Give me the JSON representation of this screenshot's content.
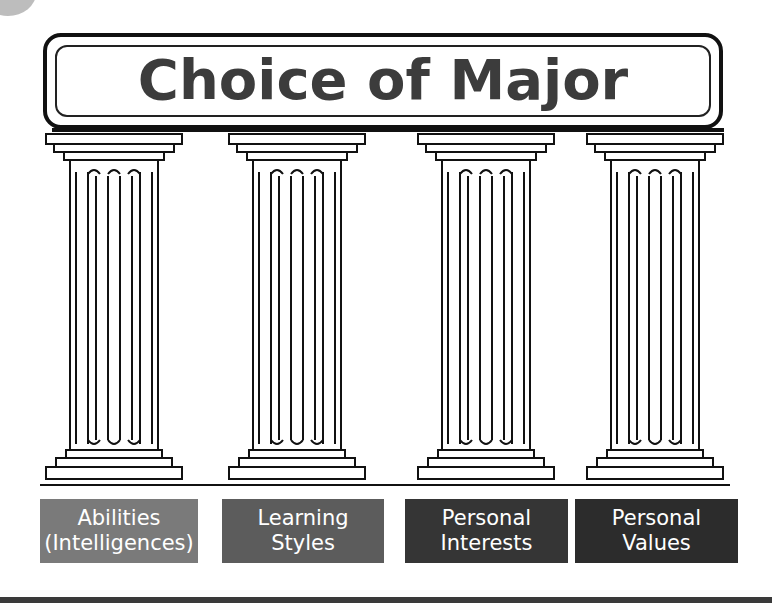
{
  "title": "Choice of Major",
  "pillars": [
    {
      "label_line1": "Abilities",
      "label_line2": "(Intelligences)",
      "color": "#7a7a7a"
    },
    {
      "label_line1": "Learning",
      "label_line2": "Styles",
      "color": "#5c5c5c"
    },
    {
      "label_line1": "Personal",
      "label_line2": "Interests",
      "color": "#353535"
    },
    {
      "label_line1": "Personal",
      "label_line2": "Values",
      "color": "#2c2c2c"
    }
  ]
}
